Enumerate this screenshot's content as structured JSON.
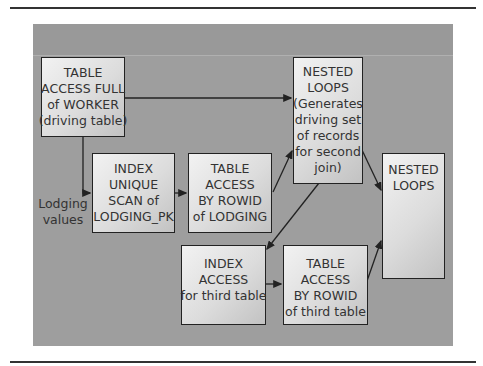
{
  "diagram": {
    "nodes": [
      {
        "id": "table-access-full-worker",
        "lines": [
          "TABLE",
          "ACCESS FULL",
          "of WORKER",
          "(driving table)"
        ]
      },
      {
        "id": "index-unique-scan-lodging-pk",
        "lines": [
          "INDEX",
          "UNIQUE",
          "SCAN of",
          "LODGING_PK"
        ]
      },
      {
        "id": "table-access-rowid-lodging",
        "lines": [
          "TABLE",
          "ACCESS",
          "BY ROWID",
          "of LODGING"
        ]
      },
      {
        "id": "nested-loops-first",
        "lines": [
          "NESTED",
          "LOOPS",
          "(Generates",
          "driving set",
          "of records",
          "for second",
          "join)"
        ]
      },
      {
        "id": "nested-loops-final",
        "lines": [
          "NESTED",
          "LOOPS"
        ]
      },
      {
        "id": "index-access-third-table",
        "lines": [
          "INDEX",
          "ACCESS",
          "for third table"
        ]
      },
      {
        "id": "table-access-rowid-third-table",
        "lines": [
          "TABLE",
          "ACCESS",
          "BY ROWID",
          "of third table"
        ]
      }
    ],
    "edge_label": [
      "Lodging",
      "values"
    ],
    "edges": [
      {
        "from": "table-access-full-worker",
        "to": "nested-loops-first"
      },
      {
        "from": "table-access-full-worker",
        "to": "index-unique-scan-lodging-pk",
        "label": "Lodging values"
      },
      {
        "from": "index-unique-scan-lodging-pk",
        "to": "table-access-rowid-lodging"
      },
      {
        "from": "table-access-rowid-lodging",
        "to": "nested-loops-first"
      },
      {
        "from": "nested-loops-first",
        "to": "nested-loops-final"
      },
      {
        "from": "nested-loops-first",
        "to": "index-access-third-table"
      },
      {
        "from": "index-access-third-table",
        "to": "table-access-rowid-third-table"
      },
      {
        "from": "table-access-rowid-third-table",
        "to": "nested-loops-final"
      }
    ]
  }
}
